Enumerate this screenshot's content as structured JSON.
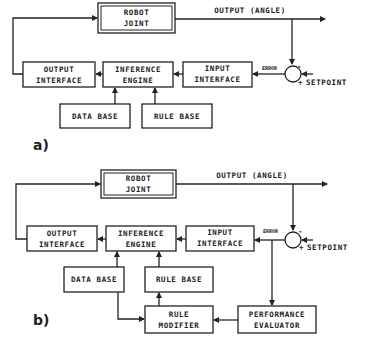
{
  "diagram_a": {
    "tag": "a)",
    "robot_joint": [
      "ROBOT",
      "JOINT"
    ],
    "output_label": "OUTPUT (ANGLE)",
    "output_interface": [
      "OUTPUT",
      "INTERFACE"
    ],
    "inference_engine": [
      "INFERENCE",
      "ENGINE"
    ],
    "input_interface": [
      "INPUT",
      "INTERFACE"
    ],
    "data_base": "DATA BASE",
    "rule_base": "RULE BASE",
    "error_label": "ERROR",
    "setpoint_label": "SETPOINT",
    "minus_sign": "-",
    "plus_sign": "+"
  },
  "diagram_b": {
    "tag": "b)",
    "robot_joint": [
      "ROBOT",
      "JOINT"
    ],
    "output_label": "OUTPUT (ANGLE)",
    "output_interface": [
      "OUTPUT",
      "INTERFACE"
    ],
    "inference_engine": [
      "INFERENCE",
      "ENGINE"
    ],
    "input_interface": [
      "INPUT",
      "INTERFACE"
    ],
    "data_base": "DATA BASE",
    "rule_base": "RULE BASE",
    "rule_modifier": [
      "RULE",
      "MODIFIER"
    ],
    "performance_evaluator": [
      "PERFORMANCE",
      "EVALUATOR"
    ],
    "error_label": "ERROR",
    "setpoint_label": "SETPOINT",
    "minus_sign": "-",
    "plus_sign": "+"
  }
}
